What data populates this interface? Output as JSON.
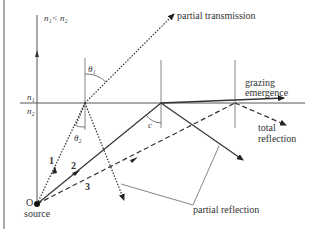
{
  "diagram": {
    "title_condition": "n₁< n₂",
    "media": {
      "upper": "n₁",
      "lower": "n₂"
    },
    "angles": {
      "incident": "θ₂",
      "refracted": "θ₁",
      "critical": "c"
    },
    "source": {
      "marker": "O",
      "label": "source"
    },
    "rays": [
      {
        "id": "1",
        "style": "dotted",
        "outcome_refracted": "partial transmission",
        "outcome_reflected": "partial reflection"
      },
      {
        "id": "2",
        "style": "solid",
        "outcome_refracted": "grazing emergence",
        "outcome_reflected": "partial reflection"
      },
      {
        "id": "3",
        "style": "dashed",
        "outcome_reflected": "total reflection"
      }
    ],
    "labels": {
      "partial_transmission": "partial transmission",
      "grazing_1": "grazing",
      "grazing_2": "emergence",
      "total_1": "total",
      "total_2": "reflection",
      "partial_reflection": "partial reflection"
    },
    "colors": {
      "line": "#333333",
      "background": "#ffffff"
    }
  }
}
